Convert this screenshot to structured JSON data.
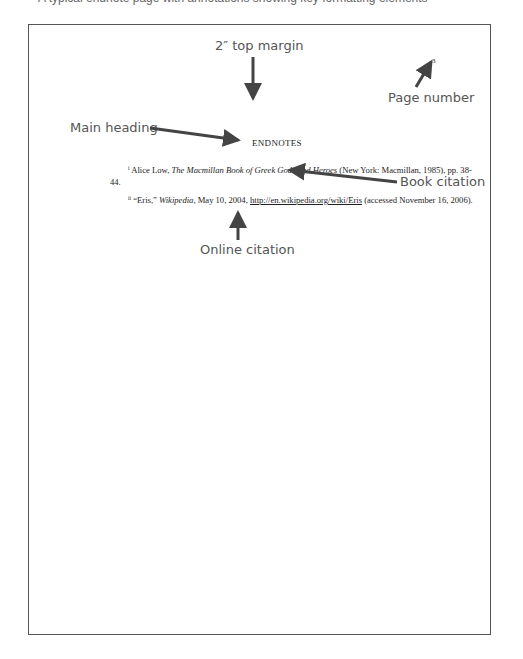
{
  "caption_clipped": "A typical endnote page with annotations showing key formatting elements",
  "annotations": {
    "top_margin": "2″ top margin",
    "main_heading": "Main heading",
    "page_number": "Page number",
    "book_citation": "Book citation",
    "online_citation": "Online citation"
  },
  "page": {
    "page_number": "3",
    "heading": "ENDNOTES",
    "notes": [
      {
        "marker": "i",
        "pre": "Alice Low, ",
        "title": "The Macmillan Book of Greek Gods and Heroes",
        "post": " (New York: Macmillan, 1985), pp. 38-44."
      },
      {
        "marker": "ii",
        "pre": "“Eris,” ",
        "title": "Wikipedia",
        "mid": ", May 10, 2004, ",
        "link": "http://en.wikipedia.org/wiki/Eris",
        "post": " (accessed November 16, 2006)."
      }
    ]
  },
  "colors": {
    "arrow": "#444444",
    "label": "#555555",
    "border": "#555555"
  }
}
